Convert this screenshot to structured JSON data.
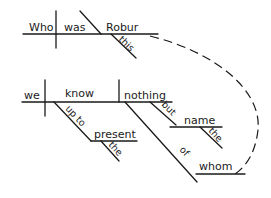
{
  "diagram": {
    "type": "sentence-diagram",
    "clause_main": {
      "subject": "Who",
      "verb": "was",
      "predicate_nominative": "Robur",
      "modifiers": {
        "Robur": [
          "this"
        ]
      }
    },
    "clause_sub": {
      "subject": "we",
      "verb": "know",
      "direct_object": "nothing",
      "modifiers": {
        "know": [
          {
            "preposition": "up to",
            "object": "present",
            "object_modifiers": [
              "the"
            ]
          }
        ],
        "nothing": [
          {
            "preposition": "but",
            "object": "name",
            "object_modifiers": [
              "the"
            ]
          },
          {
            "preposition": "of",
            "object": "whom"
          }
        ]
      }
    },
    "connector": {
      "style": "dashed",
      "from": "Robur",
      "to": "whom"
    }
  },
  "labels": {
    "who": "Who",
    "was": "was",
    "robur": "Robur",
    "this": "this",
    "we": "we",
    "know": "know",
    "nothing": "nothing",
    "up_to": "up to",
    "present": "present",
    "the1": "the",
    "but": "but",
    "name": "name",
    "the2": "the",
    "of": "of",
    "whom": "whom"
  }
}
